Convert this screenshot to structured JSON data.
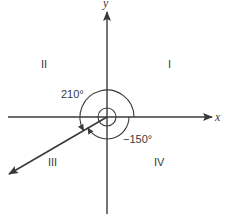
{
  "diagram": {
    "title": "",
    "axes": {
      "x_label": "x",
      "y_label": "y"
    },
    "quadrants": [
      {
        "id": "I",
        "label": "I"
      },
      {
        "id": "II",
        "label": "II"
      },
      {
        "id": "III",
        "label": "III"
      },
      {
        "id": "IV",
        "label": "IV"
      }
    ],
    "angles": [
      {
        "label": "210°",
        "value": 210,
        "direction": "counterclockwise"
      },
      {
        "label": "−150°",
        "value": -150,
        "direction": "clockwise"
      }
    ],
    "terminal_side_angle_deg": 210,
    "colors": {
      "stroke": "#3a3a3a",
      "background": "#ffffff"
    }
  }
}
